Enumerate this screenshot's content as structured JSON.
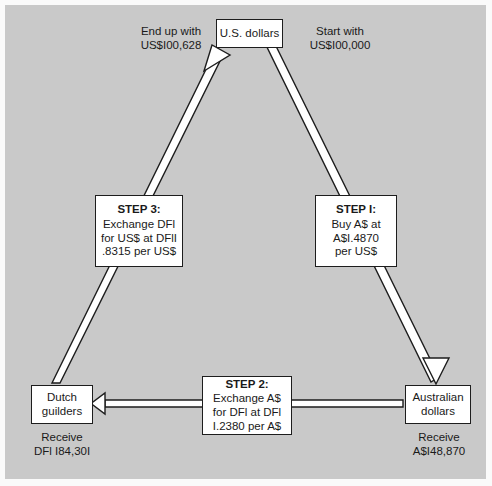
{
  "diagram": {
    "background_color": "#c9c9c9",
    "box_fill": "#ffffff",
    "line_color": "#1d1d1d",
    "nodes": {
      "usd": {
        "name": "usd-node",
        "line1": "U.S. dollars"
      },
      "aud": {
        "name": "aud-node",
        "line1": "Australian",
        "line2": "dollars"
      },
      "nlg": {
        "name": "nlg-node",
        "line1": "Dutch",
        "line2": "guilders"
      }
    },
    "steps": [
      {
        "id": "step1",
        "heading": "STEP I:",
        "line1": "Buy A$ at",
        "line2": "A$I.4870",
        "line3": "per US$"
      },
      {
        "id": "step2",
        "heading": "STEP 2:",
        "line1": "Exchange A$",
        "line2": "for DFl at DFl",
        "line3": "I.2380 per A$"
      },
      {
        "id": "step3",
        "heading": "STEP 3:",
        "line1": "Exchange DFl",
        "line2": "for US$ at DFlI",
        "line3": ".8315 per US$"
      }
    ],
    "captions": {
      "end_up": {
        "line1": "End up with",
        "line2": "US$I00,628"
      },
      "start": {
        "line1": "Start with",
        "line2": "US$I00,000"
      },
      "receive_nlg": {
        "line1": "Receive",
        "line2": "DFl I84,30I"
      },
      "receive_aud": {
        "line1": "Receive",
        "line2": "A$I48,870"
      }
    }
  }
}
